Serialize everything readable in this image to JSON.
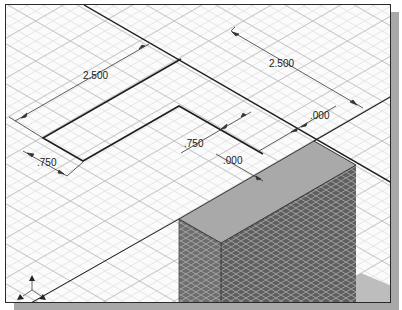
{
  "viewport": {
    "name": "isometric-3d-modeling-viewport",
    "background": "#fbfbfb",
    "grid_color": "#cfcfcf",
    "border_color": "#2a2a2a"
  },
  "dimensions": [
    {
      "id": "dim-left-length",
      "label": "2.500",
      "x": 82,
      "y": 78
    },
    {
      "id": "dim-right-length",
      "label": "2.500",
      "x": 268,
      "y": 66
    },
    {
      "id": "dim-left-width",
      "label": ".750",
      "x": 36,
      "y": 165
    },
    {
      "id": "dim-center-width",
      "label": ".750",
      "x": 183,
      "y": 146
    },
    {
      "id": "dim-offset-upper",
      "label": ".000",
      "x": 309,
      "y": 118
    },
    {
      "id": "dim-offset-lower",
      "label": ".000",
      "x": 222,
      "y": 163
    }
  ],
  "solid": {
    "top_face_color": "#a9a9a9",
    "left_face_color": "#6e6e6e",
    "right_face_color": "#5f5f5f",
    "ground_patch_color": "#bdbdbd"
  },
  "axis_triad": {
    "name": "view-axis-triad",
    "color": "#222222"
  }
}
